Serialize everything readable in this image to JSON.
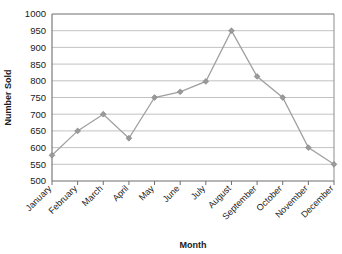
{
  "chart_data": {
    "type": "line",
    "title": "",
    "xlabel": "Month",
    "ylabel": "Number Sold",
    "categories": [
      "January",
      "February",
      "March",
      "April",
      "May",
      "June",
      "July",
      "August",
      "September",
      "October",
      "November",
      "December"
    ],
    "values": [
      577,
      650,
      700,
      628,
      750,
      767,
      798,
      950,
      813,
      750,
      600,
      550
    ],
    "series": [
      {
        "name": "Number Sold",
        "values": [
          577,
          650,
          700,
          628,
          750,
          767,
          798,
          950,
          813,
          750,
          600,
          550
        ]
      }
    ],
    "ylim": [
      500,
      1000
    ],
    "ytick_labels": [
      "500",
      "550",
      "600",
      "650",
      "700",
      "750",
      "800",
      "850",
      "900",
      "950",
      "1000"
    ],
    "ytick_values": [
      500,
      550,
      600,
      650,
      700,
      750,
      800,
      850,
      900,
      950,
      1000
    ],
    "grid": true,
    "grid_axis": "y",
    "legend": false,
    "legend_position": "none",
    "marker": "diamond",
    "line_color": "#a0a0a0",
    "marker_color": "#9a9a9a",
    "grid_color": "#b3b3b3",
    "axis_color": "#6e6e6e",
    "text_color": "#1a1a1a",
    "background": "#ffffff",
    "xtick_rotation": -45
  }
}
